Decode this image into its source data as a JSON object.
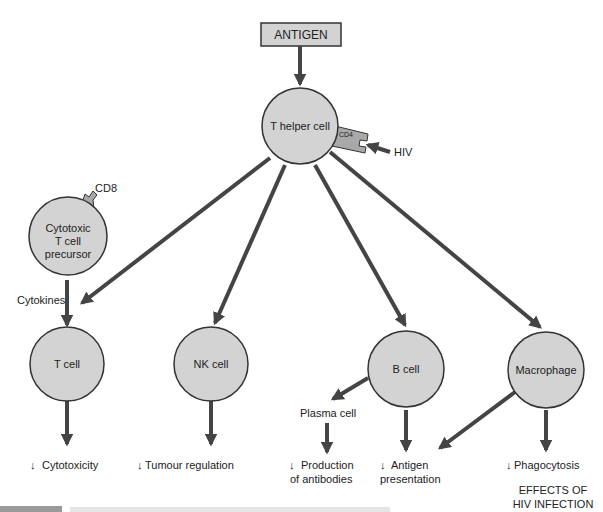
{
  "antigen": "ANTIGEN",
  "cells": {
    "thelper": "T helper cell",
    "cytotoxic": [
      "Cytotoxic",
      "T cell",
      "precursor"
    ],
    "tcell": "T cell",
    "nk": "NK cell",
    "bcell": "B cell",
    "macrophage": "Macrophage"
  },
  "receptors": {
    "cd4": "CD4",
    "cd8": "CD8"
  },
  "labels": {
    "hiv": "HIV",
    "cytokines": "Cytokines",
    "plasma": "Plasma cell"
  },
  "effects": {
    "cytotoxicity": "Cytotoxicity",
    "tumour": "Tumour regulation",
    "production": [
      "Production",
      "of antibodies"
    ],
    "antigen_pres": [
      "Antigen",
      "presentation"
    ],
    "phagocytosis": "Phagocytosis",
    "arrow_glyph": "↓"
  },
  "title": [
    "EFFECTS OF",
    "HIV INFECTION"
  ]
}
